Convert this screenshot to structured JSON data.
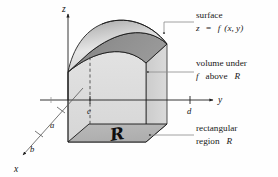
{
  "figure": {
    "background_color": "#fefefe",
    "axes": {
      "z_label": "z",
      "y_label": "y",
      "x_label": "x",
      "ticks": [
        {
          "name": "c",
          "label": "c",
          "axis": "y"
        },
        {
          "name": "d",
          "label": "d",
          "axis": "y"
        },
        {
          "name": "a",
          "label": "a",
          "axis": "x"
        },
        {
          "name": "b",
          "label": "b",
          "axis": "x"
        }
      ]
    },
    "annotations": [
      {
        "name": "surface",
        "line1": "surface",
        "line2_prefix": "z",
        "line2_eq": "=",
        "line2_fn": "f",
        "line2_args": "(x, y)"
      },
      {
        "name": "volume",
        "line1": "volume under",
        "line2_fn": "f",
        "line2_rest": "above",
        "line2_region": "R"
      },
      {
        "name": "region",
        "line1": "rectangular",
        "line2_prefix": "region",
        "line2_region": "R"
      }
    ],
    "region_glyph": "R",
    "colors": {
      "surface_top": "#b9b9b9",
      "surface_top_light": "#e8e8e8",
      "surface_under": "#8c8c8c",
      "volume_fill": "#dcdcdc",
      "volume_side": "#cfcfcf",
      "base_fill": "#b5b5b5",
      "outline": "#1a1a1a",
      "leader": "#7a7a7a",
      "axis": "#2a2a2a"
    }
  }
}
